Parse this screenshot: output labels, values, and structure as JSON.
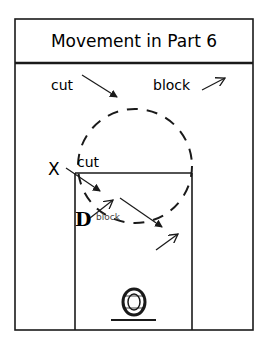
{
  "title": "Movement in Part 6",
  "legend": {
    "cut_label": "cut",
    "block_label": "block"
  },
  "court": {
    "players": [
      {
        "id": "X",
        "label": "X",
        "role": "offense"
      },
      {
        "id": "D",
        "label": "D",
        "role": "defense"
      }
    ],
    "annotations": {
      "cut_label": "cut",
      "block_label": "block"
    },
    "elements": [
      "lane",
      "dashed-circle",
      "basket"
    ]
  },
  "colors": {
    "line": "#1a1a1a",
    "background": "#ffffff"
  }
}
